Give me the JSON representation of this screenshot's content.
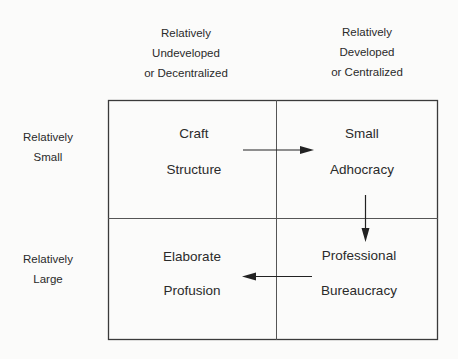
{
  "column_headers": [
    {
      "lines": [
        "Relatively",
        "Undeveloped",
        "or Decentralized"
      ]
    },
    {
      "lines": [
        "Relatively",
        "Developed",
        "or Centralized"
      ]
    }
  ],
  "row_headers": [
    {
      "lines": [
        "Relatively",
        "Small"
      ]
    },
    {
      "lines": [
        "Relatively",
        "Large"
      ]
    }
  ],
  "cells": [
    {
      "row": 0,
      "col": 0,
      "lines": [
        "Craft",
        "Structure"
      ]
    },
    {
      "row": 0,
      "col": 1,
      "lines": [
        "Small",
        "Adhocracy"
      ]
    },
    {
      "row": 1,
      "col": 0,
      "lines": [
        "Elaborate",
        "Profusion"
      ]
    },
    {
      "row": 1,
      "col": 1,
      "lines": [
        "Professional",
        "Bureaucracy"
      ]
    }
  ],
  "arrows": [
    {
      "from": "Craft Structure",
      "to": "Small Adhocracy",
      "direction": "right"
    },
    {
      "from": "Small Adhocracy",
      "to": "Professional Bureaucracy",
      "direction": "down"
    },
    {
      "from": "Professional Bureaucracy",
      "to": "Elaborate Profusion",
      "direction": "left"
    }
  ],
  "colors": {
    "line": "#3a3a3a",
    "text": "#2a2a2a",
    "background": "#fbfbfa"
  }
}
